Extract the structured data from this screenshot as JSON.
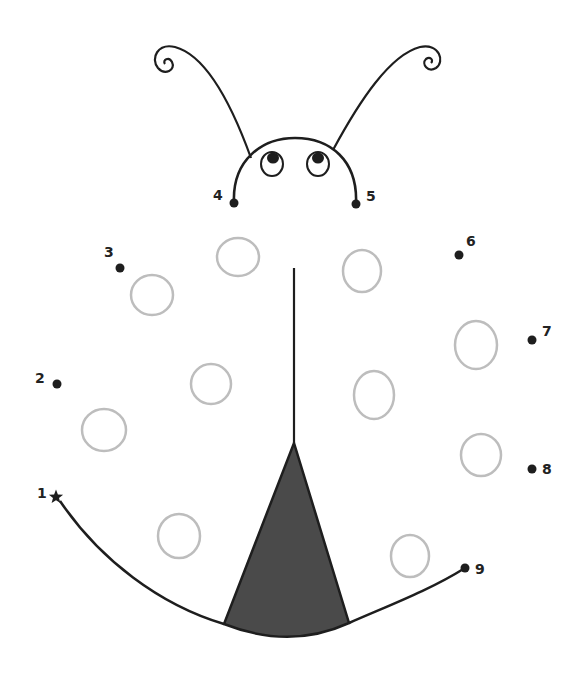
{
  "colors": {
    "ink": "#1e1e1e",
    "spot": "#bdbdbd",
    "wedge": "#4a4a4a"
  },
  "dots": [
    {
      "n": "1",
      "x": 56,
      "y": 497,
      "lx": 37,
      "ly": 498,
      "shape": "star"
    },
    {
      "n": "2",
      "x": 57,
      "y": 384,
      "lx": 35,
      "ly": 383
    },
    {
      "n": "3",
      "x": 120,
      "y": 268,
      "lx": 104,
      "ly": 257
    },
    {
      "n": "4",
      "x": 234,
      "y": 203,
      "lx": 213,
      "ly": 200
    },
    {
      "n": "5",
      "x": 356,
      "y": 204,
      "lx": 366,
      "ly": 201
    },
    {
      "n": "6",
      "x": 459,
      "y": 255,
      "lx": 466,
      "ly": 246
    },
    {
      "n": "7",
      "x": 532,
      "y": 340,
      "lx": 542,
      "ly": 336
    },
    {
      "n": "8",
      "x": 532,
      "y": 469,
      "lx": 542,
      "ly": 474
    },
    {
      "n": "9",
      "x": 465,
      "y": 568,
      "lx": 475,
      "ly": 574
    }
  ],
  "spots": [
    {
      "cx": 238,
      "cy": 257,
      "rx": 21,
      "ry": 19
    },
    {
      "cx": 362,
      "cy": 271,
      "rx": 19,
      "ry": 21
    },
    {
      "cx": 152,
      "cy": 295,
      "rx": 21,
      "ry": 20
    },
    {
      "cx": 476,
      "cy": 345,
      "rx": 21,
      "ry": 24
    },
    {
      "cx": 211,
      "cy": 384,
      "rx": 20,
      "ry": 20
    },
    {
      "cx": 374,
      "cy": 395,
      "rx": 20,
      "ry": 24
    },
    {
      "cx": 104,
      "cy": 430,
      "rx": 22,
      "ry": 21
    },
    {
      "cx": 481,
      "cy": 455,
      "rx": 20,
      "ry": 21
    },
    {
      "cx": 179,
      "cy": 536,
      "rx": 21,
      "ry": 22
    },
    {
      "cx": 410,
      "cy": 556,
      "rx": 19,
      "ry": 21
    }
  ]
}
